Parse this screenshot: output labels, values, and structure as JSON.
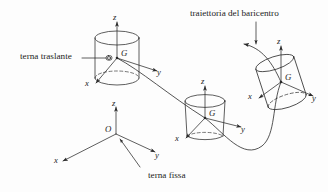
{
  "figure": {
    "title_visible": false,
    "background_color": "#fdfdfd",
    "ink_color": "#2a2a2a",
    "type": "technical-mechanics-diagram"
  },
  "captions": {
    "translating_frame": "terna traslante",
    "trajectory": "traiettoria del baricentro",
    "fixed_frame": "terna fissa"
  },
  "bodies": [
    {
      "name": "cylinder-1",
      "position": "upper-left",
      "orientation": "upright",
      "center_of_mass_label": "G",
      "axes": {
        "x": "x",
        "y": "y",
        "z": "z"
      },
      "origin_marker": true
    },
    {
      "name": "cylinder-2",
      "position": "middle",
      "orientation": "upright",
      "center_of_mass_label": "G",
      "axes": {
        "x": "x",
        "y": "y",
        "z": "z"
      },
      "origin_marker": false
    },
    {
      "name": "cylinder-3",
      "position": "right",
      "orientation": "tilted",
      "center_of_mass_label": "G",
      "axes": {
        "x": "x",
        "y": "y",
        "z": "z"
      },
      "origin_marker": false
    }
  ],
  "fixed_frame": {
    "origin_label": "O",
    "axes": {
      "x": "x",
      "y": "y",
      "z": "z"
    }
  },
  "labels": {
    "G1": "G",
    "G2": "G",
    "G3": "G",
    "z1": "z",
    "y1": "y",
    "x1": "x",
    "z2": "z",
    "y2": "y",
    "x2": "x",
    "z3": "z",
    "y3": "y",
    "x3": "x",
    "O": "O",
    "zf": "z",
    "yf": "y",
    "xf": "x"
  }
}
